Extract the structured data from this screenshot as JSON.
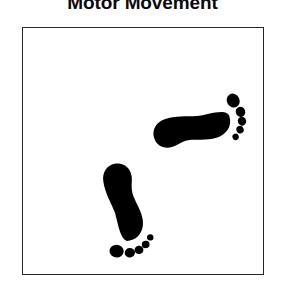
{
  "figure": {
    "title": "Motor Movement",
    "title_clipped_top": true,
    "background_color": "#ffffff",
    "ink_color": "#000000"
  },
  "panel": {
    "border_color": "#262626",
    "border_width_px": 1.5,
    "fill_color": "#ffffff",
    "x": 22,
    "y": 27,
    "width": 242,
    "height": 248
  },
  "footprints": [
    {
      "id": "upper-footprint",
      "name": "right-footprint",
      "side": "right",
      "label": "Right foot",
      "orientation": "pointing-right",
      "rotation_deg": 72,
      "center_x": 170,
      "center_y": 101,
      "scale": 1.0,
      "toe_count": 5,
      "color": "#000000"
    },
    {
      "id": "lower-footprint",
      "name": "left-footprint",
      "side": "left",
      "label": "Left foot",
      "orientation": "pointing-down",
      "rotation_deg": 172,
      "center_x": 101,
      "center_y": 175,
      "scale": 1.0,
      "toe_count": 5,
      "color": "#000000"
    }
  ],
  "foot_geometry": {
    "sole_path": "M 0,-40 C 11,-40 17,-31 17,-21 C 17,-12 13,-4 11,4 C 9,12 12,18 12,24 C 12,33 6,39 -2,39 C -11,39 -17,32 -17,23 C -17,12 -13,2 -10,-9 C -8,-19 -9,-40 0,-40 Z",
    "toes": [
      {
        "cx": -13.5,
        "cy": -48.5,
        "rx": 7.2,
        "ry": 6.4,
        "rot": -12
      },
      {
        "cx": -0.5,
        "cy": -52.0,
        "rx": 5.2,
        "ry": 4.8,
        "rot": 0
      },
      {
        "cx": 9.0,
        "cy": -50.5,
        "rx": 4.5,
        "ry": 4.2,
        "rot": 0
      },
      {
        "cx": 16.5,
        "cy": -46.0,
        "rx": 3.9,
        "ry": 3.7,
        "rot": 0
      },
      {
        "cx": 22.0,
        "cy": -39.5,
        "rx": 3.3,
        "ry": 3.2,
        "rot": 0
      }
    ]
  }
}
